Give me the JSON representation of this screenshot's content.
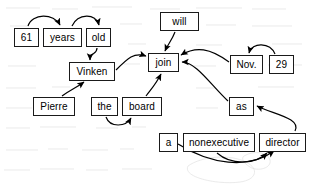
{
  "figure": {
    "kind": "dependency-parse-tree",
    "sentence": "Pierre Vinken , 61 years old , will join the board as a nonexecutive director Nov. 29 .",
    "background": "#ffffff",
    "box_border_color": "#1a1a1a",
    "box_fill_color": "#ffffff",
    "arrow_color": "#000000",
    "text_color": "#000000"
  },
  "nodes": [
    {
      "id": "n61",
      "label": "61",
      "x": 14,
      "y": 28,
      "w": 25,
      "h": 19
    },
    {
      "id": "nyears",
      "label": "years",
      "x": 43,
      "y": 28,
      "w": 39,
      "h": 19
    },
    {
      "id": "nold",
      "label": "old",
      "x": 86,
      "y": 28,
      "w": 25,
      "h": 19
    },
    {
      "id": "nvinken",
      "label": "Vinken",
      "x": 69,
      "y": 62,
      "w": 46,
      "h": 19
    },
    {
      "id": "npierre",
      "label": "Pierre",
      "x": 33,
      "y": 97,
      "w": 42,
      "h": 19
    },
    {
      "id": "nthe",
      "label": "the",
      "x": 91,
      "y": 97,
      "w": 27,
      "h": 19
    },
    {
      "id": "nboard",
      "label": "board",
      "x": 122,
      "y": 97,
      "w": 40,
      "h": 19
    },
    {
      "id": "nwill",
      "label": "will",
      "x": 160,
      "y": 12,
      "w": 39,
      "h": 19
    },
    {
      "id": "njoin",
      "label": "join",
      "x": 148,
      "y": 53,
      "w": 31,
      "h": 19
    },
    {
      "id": "nnov",
      "label": "Nov.",
      "x": 230,
      "y": 55,
      "w": 33,
      "h": 19
    },
    {
      "id": "n29",
      "label": "29",
      "x": 269,
      "y": 55,
      "w": 25,
      "h": 19
    },
    {
      "id": "nas",
      "label": "as",
      "x": 229,
      "y": 97,
      "w": 25,
      "h": 19
    },
    {
      "id": "na",
      "label": "a",
      "x": 159,
      "y": 133,
      "w": 19,
      "h": 19
    },
    {
      "id": "nnonexecutive",
      "label": "nonexecutive",
      "x": 183,
      "y": 133,
      "w": 72,
      "h": 19
    },
    {
      "id": "ndirector",
      "label": "director",
      "x": 259,
      "y": 133,
      "w": 47,
      "h": 19
    }
  ],
  "edges": [
    {
      "from": "61",
      "to": "years",
      "name": "edge-61-to-years"
    },
    {
      "from": "years",
      "to": "old",
      "name": "edge-years-to-old"
    },
    {
      "from": "old",
      "to": "Vinken",
      "name": "edge-old-to-vinken"
    },
    {
      "from": "Pierre",
      "to": "Vinken",
      "name": "edge-pierre-to-vinken"
    },
    {
      "from": "Vinken",
      "to": "join",
      "name": "edge-vinken-to-join"
    },
    {
      "from": "will",
      "to": "join",
      "name": "edge-will-to-join"
    },
    {
      "from": "the",
      "to": "board",
      "name": "edge-the-to-board"
    },
    {
      "from": "board",
      "to": "join",
      "name": "edge-board-to-join"
    },
    {
      "from": "as",
      "to": "join",
      "name": "edge-as-to-join"
    },
    {
      "from": "Nov.",
      "to": "join",
      "name": "edge-nov-to-join"
    },
    {
      "from": "29",
      "to": "Nov.",
      "name": "edge-29-to-nov"
    },
    {
      "from": "director",
      "to": "as",
      "name": "edge-director-to-as"
    },
    {
      "from": "a",
      "to": "director",
      "name": "edge-a-to-director"
    },
    {
      "from": "nonexecutive",
      "to": "director",
      "name": "edge-nonexecutive-to-director"
    }
  ]
}
